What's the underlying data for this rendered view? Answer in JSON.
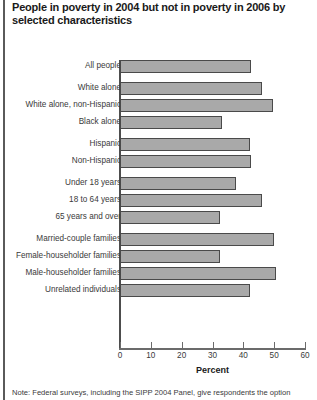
{
  "title": "People in poverty in 2004 but not in poverty in 2006 by selected characteristics",
  "note": "Note: Federal surveys, including the SIPP 2004 Panel, give respondents the option",
  "colors": {
    "bar_fill": "#a9a9a9",
    "bar_border": "#4a4a4a",
    "axis": "#6b6b6b",
    "text": "#3a3a3a"
  },
  "chart_data": {
    "type": "bar",
    "orientation": "horizontal",
    "title": "People in poverty in 2004 but not in poverty in 2006 by selected characteristics",
    "xlabel": "Percent",
    "ylabel": "",
    "xlim": [
      0,
      60
    ],
    "xticks": [
      0,
      10,
      20,
      30,
      40,
      50,
      60
    ],
    "xticklabels": [
      "0",
      "10",
      "20",
      "30",
      "40",
      "50",
      "60"
    ],
    "grid": false,
    "legend": false,
    "categories": [
      "All people",
      "White alone",
      "White alone, non-Hispanic",
      "Black alone",
      "Hispanic",
      "Non-Hispanic",
      "Under 18 years",
      "18 to 64 years",
      "65 years and over",
      "Married-couple families",
      "Female-householder families",
      "Male-householder families",
      "Unrelated individuals"
    ],
    "values": [
      42.5,
      46.0,
      49.5,
      33.0,
      42.0,
      42.5,
      37.5,
      46.0,
      32.5,
      50.0,
      32.5,
      50.5,
      42.0
    ],
    "groups": [
      {
        "name": "total",
        "categories": [
          "All people"
        ]
      },
      {
        "name": "race",
        "categories": [
          "White alone",
          "White alone, non-Hispanic",
          "Black alone"
        ]
      },
      {
        "name": "ethnicity",
        "categories": [
          "Hispanic",
          "Non-Hispanic"
        ]
      },
      {
        "name": "age",
        "categories": [
          "Under 18 years",
          "18 to 64 years",
          "65 years and over"
        ]
      },
      {
        "name": "family-type",
        "categories": [
          "Married-couple families",
          "Female-householder families",
          "Male-householder families",
          "Unrelated individuals"
        ]
      }
    ]
  }
}
